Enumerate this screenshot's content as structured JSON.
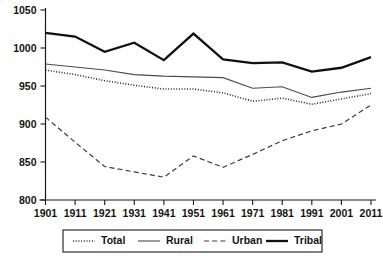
{
  "chart_data": {
    "type": "line",
    "title": "",
    "subtitle": "",
    "xlabel": "",
    "ylabel": "",
    "x": [
      1901,
      1911,
      1921,
      1931,
      1941,
      1951,
      1961,
      1971,
      1981,
      1991,
      2001,
      2011
    ],
    "xticklabels": [
      "1901",
      "1911",
      "1921",
      "1931",
      "1941",
      "1951",
      "1961",
      "1971",
      "1981",
      "1991",
      "2001",
      "2011"
    ],
    "yticks": [
      800,
      850,
      900,
      950,
      1000,
      1050
    ],
    "yticklabels": [
      "800",
      "850",
      "900",
      "950",
      "1000",
      "1050"
    ],
    "ylim": [
      800,
      1050
    ],
    "xlim": [
      1901,
      2011
    ],
    "grid": false,
    "legend_position": "bottom",
    "series": [
      {
        "name": "Total",
        "style": "dotted",
        "color": "#2b2b2b",
        "width": 1.6,
        "values": [
          971,
          965,
          957,
          951,
          946,
          946,
          941,
          930,
          934,
          926,
          933,
          940
        ]
      },
      {
        "name": "Rural",
        "style": "solid-thin",
        "color": "#4a4a4a",
        "width": 1.1,
        "values": [
          979,
          975,
          971,
          965,
          963,
          962,
          961,
          947,
          949,
          935,
          942,
          947
        ]
      },
      {
        "name": "Urban",
        "style": "dashed",
        "color": "#3d3d3d",
        "width": 1.2,
        "values": [
          909,
          876,
          844,
          837,
          830,
          858,
          843,
          860,
          878,
          891,
          900,
          925
        ]
      },
      {
        "name": "Tribal",
        "style": "solid-thick",
        "color": "#111111",
        "width": 2.3,
        "values": [
          1020,
          1015,
          995,
          1007,
          984,
          1019,
          985,
          980,
          981,
          969,
          974,
          988
        ]
      }
    ]
  },
  "legend": {
    "entries": [
      {
        "label": "Total"
      },
      {
        "label": "Rural"
      },
      {
        "label": "Urban"
      },
      {
        "label": "Tribal"
      }
    ]
  }
}
